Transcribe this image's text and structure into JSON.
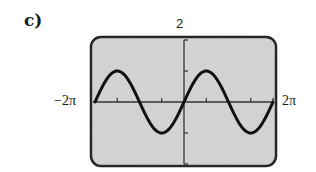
{
  "part_label": "c)",
  "chart_data": {
    "type": "line",
    "title": "",
    "function": "y = sin(x)",
    "xlabel": "",
    "ylabel": "",
    "xlim_labels": [
      "-2π",
      "2π"
    ],
    "xlim": [
      -6.2832,
      6.2832
    ],
    "ylim": [
      -2,
      2
    ],
    "ymax_label": "2",
    "x_ticks": [
      -4.7124,
      -1.5708,
      1.5708,
      4.7124
    ],
    "y_ticks": [
      -1,
      1
    ],
    "grid": false,
    "legend": null,
    "series": [
      {
        "name": "sin x",
        "x": [
          -6.2832,
          -4.7124,
          -3.1416,
          -1.5708,
          0,
          1.5708,
          3.1416,
          4.7124,
          6.2832
        ],
        "values": [
          0,
          1,
          0,
          -1,
          0,
          1,
          0,
          -1,
          0
        ]
      }
    ],
    "colors": {
      "screen": "#d4d4d4",
      "frame": "#222222",
      "curve": "#111111"
    }
  },
  "labels": {
    "ymax": "2",
    "xmin": "−2π",
    "xmax": "2π"
  }
}
